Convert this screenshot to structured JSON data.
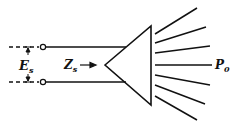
{
  "diagram": {
    "type": "source-to-horn-radiator",
    "labels": {
      "source_voltage": {
        "main": "E",
        "sub": "s"
      },
      "source_impedance": {
        "main": "Z",
        "sub": "s"
      },
      "radiated_power": {
        "main": "P",
        "sub": "0"
      }
    },
    "colors": {
      "stroke": "#111111",
      "background": "#ffffff"
    },
    "elements": [
      "dashed-input-lines",
      "terminal-circles",
      "transmission-wires",
      "horn-triangle",
      "radiation-rays"
    ],
    "ray_count": 7
  }
}
